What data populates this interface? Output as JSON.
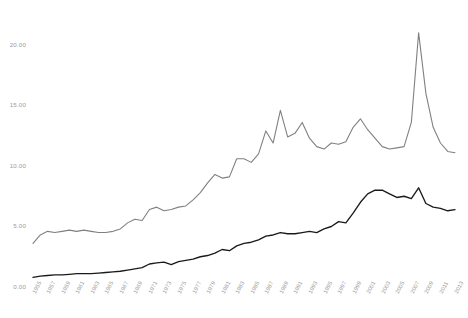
{
  "chart_data": {
    "type": "line",
    "title": "",
    "subtitle": "",
    "xlabel": "",
    "ylabel": "",
    "xlim": [
      1955,
      2013
    ],
    "ylim": [
      0.0,
      22.0
    ],
    "grid": false,
    "legend_position": "none",
    "y_ticks": [
      "0.00",
      "5.00",
      "10.00",
      "15.00",
      "20.00"
    ],
    "y_tick_values": [
      0,
      5,
      10,
      15,
      20
    ],
    "x_ticks": [
      "1955",
      "1957",
      "1959",
      "1961",
      "1963",
      "1965",
      "1967",
      "1969",
      "1971",
      "1973",
      "1975",
      "1977",
      "1979",
      "1981",
      "1983",
      "1985",
      "1987",
      "1989",
      "1991",
      "1993",
      "1995",
      "1997",
      "1999",
      "2001",
      "2003",
      "2005",
      "2007",
      "2009",
      "2011",
      "2013"
    ],
    "x": [
      1955,
      1956,
      1957,
      1958,
      1959,
      1960,
      1961,
      1962,
      1963,
      1964,
      1965,
      1966,
      1967,
      1968,
      1969,
      1970,
      1971,
      1972,
      1973,
      1974,
      1975,
      1976,
      1977,
      1978,
      1979,
      1980,
      1981,
      1982,
      1983,
      1984,
      1985,
      1986,
      1987,
      1988,
      1989,
      1990,
      1991,
      1992,
      1993,
      1994,
      1995,
      1996,
      1997,
      1998,
      1999,
      2000,
      2001,
      2002,
      2003,
      2004,
      2005,
      2006,
      2007,
      2008,
      2009,
      2010,
      2011,
      2012,
      2013
    ],
    "series": [
      {
        "name": "upper-gray-series",
        "color": "#808080",
        "values": [
          3.6,
          4.3,
          4.6,
          4.5,
          4.6,
          4.7,
          4.6,
          4.7,
          4.6,
          4.5,
          4.5,
          4.6,
          4.8,
          5.3,
          5.6,
          5.5,
          6.4,
          6.6,
          6.3,
          6.4,
          6.6,
          6.7,
          7.2,
          7.8,
          8.6,
          9.3,
          9.0,
          9.1,
          10.6,
          10.6,
          10.3,
          11.0,
          12.9,
          11.9,
          14.6,
          12.4,
          12.7,
          13.6,
          12.3,
          11.6,
          11.4,
          11.9,
          11.8,
          12.0,
          13.2,
          13.9,
          13.0,
          12.3,
          11.6,
          11.4,
          11.5,
          11.6,
          13.6,
          21.0,
          16.0,
          13.2,
          11.9,
          11.2,
          11.1
        ]
      },
      {
        "name": "lower-black-series",
        "color": "#1a1a1a",
        "values": [
          0.8,
          0.9,
          0.95,
          1.0,
          1.0,
          1.05,
          1.1,
          1.1,
          1.1,
          1.15,
          1.2,
          1.25,
          1.3,
          1.4,
          1.5,
          1.6,
          1.9,
          2.0,
          2.05,
          1.85,
          2.1,
          2.2,
          2.3,
          2.5,
          2.6,
          2.8,
          3.1,
          3.0,
          3.4,
          3.6,
          3.7,
          3.9,
          4.2,
          4.3,
          4.5,
          4.4,
          4.4,
          4.5,
          4.6,
          4.5,
          4.8,
          5.0,
          5.4,
          5.3,
          6.1,
          7.0,
          7.7,
          8.0,
          8.0,
          7.7,
          7.4,
          7.5,
          7.3,
          8.2,
          6.9,
          6.6,
          6.5,
          6.3,
          6.4
        ]
      }
    ]
  }
}
